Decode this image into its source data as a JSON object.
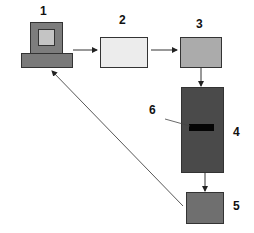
{
  "diagram": {
    "nodes": [
      {
        "id": "1",
        "label": "1",
        "kind": "computer",
        "colors": {
          "monitor": "#7d7d7d",
          "screen": "#c4c4c4",
          "base": "#7a7a7a"
        }
      },
      {
        "id": "2",
        "label": "2",
        "kind": "box",
        "color": "#ececec"
      },
      {
        "id": "3",
        "label": "3",
        "kind": "box",
        "color": "#ababab"
      },
      {
        "id": "4",
        "label": "4",
        "kind": "gel",
        "color": "#4a4a4a",
        "band_color": "#050505"
      },
      {
        "id": "5",
        "label": "5",
        "kind": "box",
        "color": "#6f6f6f"
      }
    ],
    "callouts": [
      {
        "id": "6",
        "label": "6",
        "target": "band in 4"
      }
    ],
    "edges": [
      {
        "from": "1",
        "to": "2"
      },
      {
        "from": "2",
        "to": "3"
      },
      {
        "from": "3",
        "to": "4"
      },
      {
        "from": "4",
        "to": "5"
      },
      {
        "from": "5",
        "to": "1"
      }
    ]
  }
}
